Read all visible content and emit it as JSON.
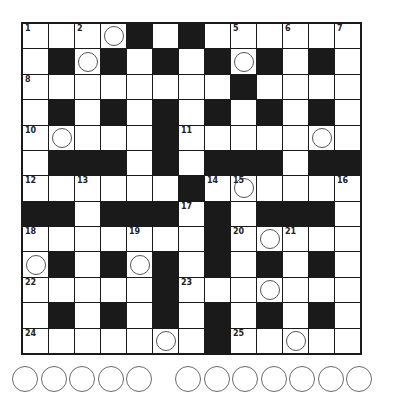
{
  "puzzle": {
    "type": "crossword",
    "rows": 13,
    "cols": 13,
    "layout": [
      "....#.#......",
      ".#.#.#.#.#.#.",
      "........#....",
      ".#.#.#.#.#.#.",
      ".....#.......",
      ".###.#.###.##",
      "......#......",
      "##.###.#.###.",
      ".......#.....",
      ".#.#.#.#.#.#.",
      ".....#.......",
      ".#.#.#.#.#.#.",
      ".......#....."
    ],
    "numbers": [
      {
        "r": 0,
        "c": 0,
        "n": "1"
      },
      {
        "r": 0,
        "c": 2,
        "n": "2"
      },
      {
        "r": 0,
        "c": 4,
        "n": "3"
      },
      {
        "r": 0,
        "c": 6,
        "n": "4"
      },
      {
        "r": 0,
        "c": 8,
        "n": "5"
      },
      {
        "r": 0,
        "c": 10,
        "n": "6"
      },
      {
        "r": 0,
        "c": 12,
        "n": "7"
      },
      {
        "r": 2,
        "c": 0,
        "n": "8"
      },
      {
        "r": 2,
        "c": 8,
        "n": "9"
      },
      {
        "r": 4,
        "c": 0,
        "n": "10"
      },
      {
        "r": 4,
        "c": 6,
        "n": "11"
      },
      {
        "r": 6,
        "c": 0,
        "n": "12"
      },
      {
        "r": 6,
        "c": 2,
        "n": "13"
      },
      {
        "r": 6,
        "c": 7,
        "n": "14"
      },
      {
        "r": 6,
        "c": 8,
        "n": "15"
      },
      {
        "r": 6,
        "c": 12,
        "n": "16"
      },
      {
        "r": 7,
        "c": 6,
        "n": "17"
      },
      {
        "r": 8,
        "c": 0,
        "n": "18"
      },
      {
        "r": 8,
        "c": 4,
        "n": "19"
      },
      {
        "r": 8,
        "c": 8,
        "n": "20"
      },
      {
        "r": 8,
        "c": 10,
        "n": "21"
      },
      {
        "r": 10,
        "c": 0,
        "n": "22"
      },
      {
        "r": 10,
        "c": 6,
        "n": "23"
      },
      {
        "r": 12,
        "c": 0,
        "n": "24"
      },
      {
        "r": 12,
        "c": 8,
        "n": "25"
      }
    ],
    "circled_cells": [
      {
        "r": 0,
        "c": 3
      },
      {
        "r": 1,
        "c": 2
      },
      {
        "r": 1,
        "c": 8
      },
      {
        "r": 4,
        "c": 1
      },
      {
        "r": 4,
        "c": 11
      },
      {
        "r": 6,
        "c": 8
      },
      {
        "r": 8,
        "c": 9
      },
      {
        "r": 9,
        "c": 0
      },
      {
        "r": 9,
        "c": 4
      },
      {
        "r": 10,
        "c": 9
      },
      {
        "r": 12,
        "c": 5
      },
      {
        "r": 12,
        "c": 10
      }
    ],
    "answer_slots": {
      "groups": [
        5,
        7
      ]
    }
  },
  "colors": {
    "black_cell": "#1a1a1a",
    "white_cell": "#ffffff",
    "circle_stroke": "#555555"
  }
}
